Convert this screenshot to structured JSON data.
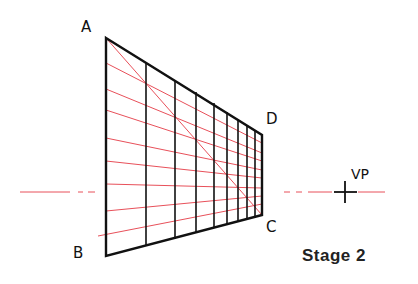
{
  "labels": {
    "a": "A",
    "b": "B",
    "c": "C",
    "d": "D",
    "vp": "VP",
    "stage": "Stage 2"
  },
  "colors": {
    "ink": "#111111",
    "construction": "#e8505a"
  },
  "geometry": {
    "A": [
      106,
      38
    ],
    "B": [
      106,
      256
    ],
    "C": [
      262,
      215
    ],
    "D": [
      262,
      135
    ],
    "VP": [
      345,
      190
    ],
    "vertical_lines_x": [
      106,
      146,
      175,
      196,
      214,
      227,
      238,
      247,
      255,
      262
    ],
    "horizontal_red_left_y": [
      63,
      89,
      110,
      138,
      161,
      184,
      211,
      234
    ]
  }
}
